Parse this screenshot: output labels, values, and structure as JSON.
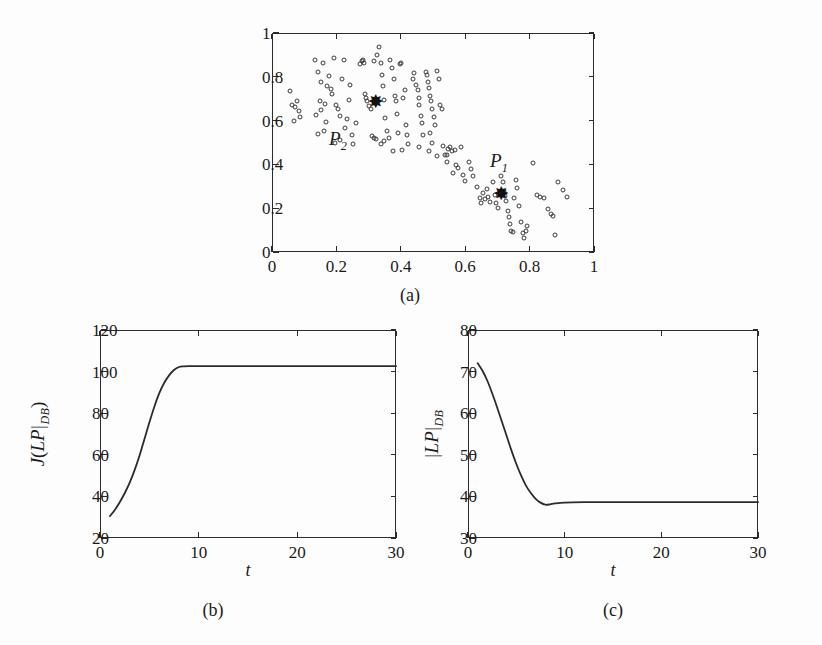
{
  "figure": {
    "background_color": "#fdfdfd",
    "line_color": "#2b2b2b",
    "marker_color": "#3a3a3a"
  },
  "panels": {
    "a": {
      "caption": "(a)",
      "cluster_labels": [
        {
          "name": "p1-label",
          "text": "P",
          "subscript": "1",
          "x": 0.705,
          "y": 0.405
        },
        {
          "name": "p2-label",
          "text": "P",
          "subscript": "2",
          "x": 0.205,
          "y": 0.505
        }
      ]
    },
    "b": {
      "caption": "(b)"
    },
    "c": {
      "caption": "(c)"
    }
  },
  "chart_data": [
    {
      "id": "panel-a-scatter",
      "type": "scatter",
      "title": "",
      "subtitle": "(a)",
      "xlabel": "",
      "ylabel": "",
      "xlim": [
        0,
        1
      ],
      "ylim": [
        0,
        1
      ],
      "xticks": [
        0,
        0.2,
        0.4,
        0.6,
        0.8,
        1
      ],
      "xticklabels": [
        "0",
        "0.2",
        "0.4",
        "0.6",
        "0.8",
        "1"
      ],
      "yticks": [
        0,
        0.2,
        0.4,
        0.6,
        0.8,
        1
      ],
      "yticklabels": [
        "0",
        "0.2",
        "0.4",
        "0.6",
        "0.8",
        "1"
      ],
      "grid": false,
      "legend": "none",
      "marker": "open-circle",
      "points": [
        [
          0.055,
          0.735
        ],
        [
          0.062,
          0.672
        ],
        [
          0.072,
          0.662
        ],
        [
          0.078,
          0.688
        ],
        [
          0.085,
          0.645
        ],
        [
          0.088,
          0.618
        ],
        [
          0.068,
          0.598
        ],
        [
          0.132,
          0.878
        ],
        [
          0.142,
          0.822
        ],
        [
          0.152,
          0.778
        ],
        [
          0.158,
          0.862
        ],
        [
          0.148,
          0.688
        ],
        [
          0.152,
          0.648
        ],
        [
          0.138,
          0.624
        ],
        [
          0.142,
          0.538
        ],
        [
          0.162,
          0.552
        ],
        [
          0.168,
          0.592
        ],
        [
          0.172,
          0.758
        ],
        [
          0.178,
          0.805
        ],
        [
          0.182,
          0.745
        ],
        [
          0.186,
          0.722
        ],
        [
          0.165,
          0.678
        ],
        [
          0.192,
          0.888
        ],
        [
          0.198,
          0.672
        ],
        [
          0.205,
          0.655
        ],
        [
          0.212,
          0.622
        ],
        [
          0.218,
          0.788
        ],
        [
          0.224,
          0.875
        ],
        [
          0.228,
          0.565
        ],
        [
          0.232,
          0.608
        ],
        [
          0.238,
          0.695
        ],
        [
          0.242,
          0.762
        ],
        [
          0.196,
          0.498
        ],
        [
          0.212,
          0.512
        ],
        [
          0.248,
          0.535
        ],
        [
          0.252,
          0.492
        ],
        [
          0.262,
          0.588
        ],
        [
          0.272,
          0.858
        ],
        [
          0.278,
          0.872
        ],
        [
          0.282,
          0.875
        ],
        [
          0.285,
          0.862
        ],
        [
          0.288,
          0.722
        ],
        [
          0.292,
          0.705
        ],
        [
          0.296,
          0.688
        ],
        [
          0.302,
          0.668
        ],
        [
          0.308,
          0.655
        ],
        [
          0.312,
          0.528
        ],
        [
          0.316,
          0.522
        ],
        [
          0.322,
          0.518
        ],
        [
          0.318,
          0.872
        ],
        [
          0.325,
          0.898
        ],
        [
          0.332,
          0.938
        ],
        [
          0.338,
          0.862
        ],
        [
          0.342,
          0.808
        ],
        [
          0.345,
          0.758
        ],
        [
          0.348,
          0.692
        ],
        [
          0.352,
          0.612
        ],
        [
          0.356,
          0.552
        ],
        [
          0.338,
          0.492
        ],
        [
          0.348,
          0.508
        ],
        [
          0.362,
          0.522
        ],
        [
          0.368,
          0.876
        ],
        [
          0.372,
          0.838
        ],
        [
          0.378,
          0.792
        ],
        [
          0.382,
          0.712
        ],
        [
          0.385,
          0.688
        ],
        [
          0.388,
          0.628
        ],
        [
          0.392,
          0.545
        ],
        [
          0.375,
          0.462
        ],
        [
          0.398,
          0.858
        ],
        [
          0.402,
          0.862
        ],
        [
          0.408,
          0.705
        ],
        [
          0.412,
          0.742
        ],
        [
          0.415,
          0.578
        ],
        [
          0.418,
          0.532
        ],
        [
          0.422,
          0.492
        ],
        [
          0.405,
          0.465
        ],
        [
          0.438,
          0.792
        ],
        [
          0.442,
          0.818
        ],
        [
          0.448,
          0.762
        ],
        [
          0.452,
          0.742
        ],
        [
          0.455,
          0.705
        ],
        [
          0.458,
          0.672
        ],
        [
          0.462,
          0.622
        ],
        [
          0.465,
          0.588
        ],
        [
          0.468,
          0.532
        ],
        [
          0.455,
          0.478
        ],
        [
          0.478,
          0.822
        ],
        [
          0.482,
          0.808
        ],
        [
          0.486,
          0.778
        ],
        [
          0.488,
          0.748
        ],
        [
          0.492,
          0.712
        ],
        [
          0.495,
          0.688
        ],
        [
          0.498,
          0.652
        ],
        [
          0.502,
          0.618
        ],
        [
          0.505,
          0.578
        ],
        [
          0.492,
          0.545
        ],
        [
          0.498,
          0.498
        ],
        [
          0.488,
          0.462
        ],
        [
          0.512,
          0.825
        ],
        [
          0.518,
          0.788
        ],
        [
          0.522,
          0.672
        ],
        [
          0.528,
          0.652
        ],
        [
          0.532,
          0.482
        ],
        [
          0.538,
          0.445
        ],
        [
          0.542,
          0.442
        ],
        [
          0.512,
          0.438
        ],
        [
          0.548,
          0.472
        ],
        [
          0.552,
          0.478
        ],
        [
          0.558,
          0.462
        ],
        [
          0.545,
          0.412
        ],
        [
          0.568,
          0.468
        ],
        [
          0.572,
          0.398
        ],
        [
          0.578,
          0.382
        ],
        [
          0.562,
          0.362
        ],
        [
          0.588,
          0.478
        ],
        [
          0.592,
          0.352
        ],
        [
          0.598,
          0.322
        ],
        [
          0.612,
          0.412
        ],
        [
          0.618,
          0.378
        ],
        [
          0.625,
          0.345
        ],
        [
          0.638,
          0.298
        ],
        [
          0.645,
          0.248
        ],
        [
          0.648,
          0.222
        ],
        [
          0.655,
          0.268
        ],
        [
          0.662,
          0.242
        ],
        [
          0.668,
          0.288
        ],
        [
          0.672,
          0.252
        ],
        [
          0.678,
          0.228
        ],
        [
          0.685,
          0.318
        ],
        [
          0.692,
          0.258
        ],
        [
          0.695,
          0.222
        ],
        [
          0.702,
          0.202
        ],
        [
          0.712,
          0.345
        ],
        [
          0.718,
          0.318
        ],
        [
          0.722,
          0.278
        ],
        [
          0.725,
          0.255
        ],
        [
          0.728,
          0.232
        ],
        [
          0.732,
          0.188
        ],
        [
          0.735,
          0.162
        ],
        [
          0.738,
          0.128
        ],
        [
          0.742,
          0.098
        ],
        [
          0.748,
          0.092
        ],
        [
          0.752,
          0.248
        ],
        [
          0.758,
          0.328
        ],
        [
          0.762,
          0.292
        ],
        [
          0.768,
          0.212
        ],
        [
          0.772,
          0.138
        ],
        [
          0.778,
          0.085
        ],
        [
          0.782,
          0.062
        ],
        [
          0.788,
          0.095
        ],
        [
          0.792,
          0.118
        ],
        [
          0.812,
          0.408
        ],
        [
          0.822,
          0.262
        ],
        [
          0.832,
          0.252
        ],
        [
          0.845,
          0.245
        ],
        [
          0.858,
          0.198
        ],
        [
          0.865,
          0.172
        ],
        [
          0.872,
          0.165
        ],
        [
          0.878,
          0.078
        ],
        [
          0.888,
          0.318
        ],
        [
          0.905,
          0.282
        ],
        [
          0.915,
          0.252
        ]
      ],
      "centroids": [
        {
          "label": "P1",
          "x": 0.712,
          "y": 0.268
        },
        {
          "label": "P2",
          "x": 0.322,
          "y": 0.688
        }
      ],
      "annotations": [
        {
          "text": "P_1",
          "x": 0.705,
          "y": 0.405
        },
        {
          "text": "P_2",
          "x": 0.205,
          "y": 0.505
        }
      ]
    },
    {
      "id": "panel-b-objective",
      "type": "line",
      "title": "",
      "subtitle": "(b)",
      "xlabel": "t",
      "ylabel": "J(LP|DB)",
      "ylabel_parts": {
        "prefix": "J(",
        "mathvar": "LP",
        "bar": "|",
        "sub": "DB",
        "suffix": ")"
      },
      "xlim": [
        0,
        30
      ],
      "ylim": [
        20,
        120
      ],
      "xticks": [
        0,
        10,
        20,
        30
      ],
      "xticklabels": [
        "0",
        "10",
        "20",
        "30"
      ],
      "yticks": [
        20,
        40,
        60,
        80,
        100,
        120
      ],
      "yticklabels": [
        "20",
        "40",
        "60",
        "80",
        "100",
        "120"
      ],
      "grid": false,
      "legend": "none",
      "x": [
        1,
        1.5,
        2,
        2.5,
        3,
        3.5,
        4,
        4.5,
        5,
        5.5,
        6,
        6.5,
        7,
        7.5,
        8,
        8.5,
        9,
        10,
        12,
        14,
        16,
        18,
        20,
        22,
        24,
        26,
        28,
        30
      ],
      "values": [
        30.5,
        33.5,
        37.2,
        41.5,
        46.5,
        52.5,
        59.5,
        67.5,
        75.5,
        83.0,
        89.5,
        94.5,
        98.2,
        100.8,
        102.2,
        102.5,
        102.6,
        102.6,
        102.6,
        102.6,
        102.6,
        102.6,
        102.6,
        102.6,
        102.6,
        102.6,
        102.6,
        102.6
      ]
    },
    {
      "id": "panel-c-cardinality",
      "type": "line",
      "title": "",
      "subtitle": "(c)",
      "xlabel": "t",
      "ylabel": "|LP|DB",
      "ylabel_parts": {
        "prefix": "|",
        "mathvar": "LP",
        "bar": "|",
        "sub": "DB",
        "suffix": ""
      },
      "xlim": [
        0,
        30
      ],
      "ylim": [
        30,
        80
      ],
      "xticks": [
        0,
        10,
        20,
        30
      ],
      "xticklabels": [
        "0",
        "10",
        "20",
        "30"
      ],
      "yticks": [
        30,
        40,
        50,
        60,
        70,
        80
      ],
      "yticklabels": [
        "30",
        "40",
        "50",
        "60",
        "70",
        "80"
      ],
      "grid": false,
      "legend": "none",
      "x": [
        1,
        1.5,
        2,
        2.5,
        3,
        3.5,
        4,
        4.5,
        5,
        5.5,
        6,
        6.5,
        7,
        7.5,
        8,
        8.5,
        9,
        10,
        12,
        14,
        16,
        18,
        20,
        22,
        24,
        26,
        28,
        30
      ],
      "values": [
        72.0,
        70.2,
        67.8,
        64.8,
        61.5,
        58.0,
        54.5,
        51.0,
        47.8,
        45.0,
        42.6,
        40.8,
        39.4,
        38.5,
        38.0,
        38.1,
        38.3,
        38.5,
        38.6,
        38.6,
        38.6,
        38.6,
        38.6,
        38.6,
        38.6,
        38.6,
        38.6,
        38.6
      ]
    }
  ]
}
